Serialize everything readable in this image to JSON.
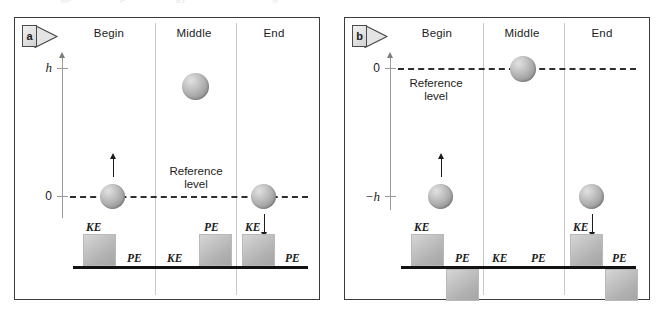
{
  "figure": {
    "caption_cut_off": "",
    "panels": [
      {
        "id": "a",
        "marker_letter": "a",
        "columns": [
          {
            "key": "begin",
            "label": "Begin"
          },
          {
            "key": "middle",
            "label": "Middle"
          },
          {
            "key": "end",
            "label": "End"
          }
        ],
        "axis": {
          "ticks": [
            {
              "key": "h",
              "label": "h",
              "italic": true
            },
            {
              "key": "zero",
              "label": "0",
              "italic": false
            }
          ]
        },
        "reference_label": {
          "line1": "Reference",
          "line2": "level"
        },
        "reference_level_value": "0",
        "balls": [
          {
            "column": "begin",
            "level": "0",
            "arrow": "up"
          },
          {
            "column": "middle",
            "level": "h",
            "arrow": "none"
          },
          {
            "column": "end",
            "level": "0",
            "arrow": "down"
          }
        ],
        "energy_bars": [
          {
            "column": "begin",
            "type": "KE",
            "label": "KE",
            "magnitude": "full",
            "direction": "above",
            "shown": true
          },
          {
            "column": "begin",
            "type": "PE",
            "label": "PE",
            "magnitude": "zero",
            "direction": "above",
            "shown": false
          },
          {
            "column": "middle",
            "type": "KE",
            "label": "KE",
            "magnitude": "zero",
            "direction": "above",
            "shown": false
          },
          {
            "column": "middle",
            "type": "PE",
            "label": "PE",
            "magnitude": "full",
            "direction": "above",
            "shown": true
          },
          {
            "column": "end",
            "type": "KE",
            "label": "KE",
            "magnitude": "full",
            "direction": "above",
            "shown": true
          },
          {
            "column": "end",
            "type": "PE",
            "label": "PE",
            "magnitude": "zero",
            "direction": "above",
            "shown": false
          }
        ]
      },
      {
        "id": "b",
        "marker_letter": "b",
        "columns": [
          {
            "key": "begin",
            "label": "Begin"
          },
          {
            "key": "middle",
            "label": "Middle"
          },
          {
            "key": "end",
            "label": "End"
          }
        ],
        "axis": {
          "ticks": [
            {
              "key": "zero",
              "label": "0",
              "italic": false
            },
            {
              "key": "minus_h",
              "label": "−h",
              "italic": true
            }
          ]
        },
        "reference_label": {
          "line1": "Reference",
          "line2": "level"
        },
        "reference_level_value": "0",
        "balls": [
          {
            "column": "begin",
            "level": "-h",
            "arrow": "up"
          },
          {
            "column": "middle",
            "level": "0",
            "arrow": "none"
          },
          {
            "column": "end",
            "level": "-h",
            "arrow": "down"
          }
        ],
        "energy_bars": [
          {
            "column": "begin",
            "type": "KE",
            "label": "KE",
            "magnitude": "full",
            "direction": "above",
            "shown": true
          },
          {
            "column": "begin",
            "type": "PE",
            "label": "PE",
            "magnitude": "negative",
            "direction": "below",
            "shown": true
          },
          {
            "column": "middle",
            "type": "KE",
            "label": "KE",
            "magnitude": "zero",
            "direction": "above",
            "shown": false
          },
          {
            "column": "middle",
            "type": "PE",
            "label": "PE",
            "magnitude": "zero",
            "direction": "above",
            "shown": false
          },
          {
            "column": "end",
            "type": "KE",
            "label": "KE",
            "magnitude": "full",
            "direction": "above",
            "shown": true
          },
          {
            "column": "end",
            "type": "PE",
            "label": "PE",
            "magnitude": "negative",
            "direction": "below",
            "shown": true
          }
        ]
      }
    ]
  },
  "panel_a": {
    "marker": "a",
    "head_begin": "Begin",
    "head_middle": "Middle",
    "head_end": "End",
    "tick_top": "h",
    "tick_zero": "0",
    "ref_line1": "Reference",
    "ref_line2": "level",
    "lbl_begin_ke": "KE",
    "lbl_begin_pe": "PE",
    "lbl_middle_ke": "KE",
    "lbl_middle_pe": "PE",
    "lbl_end_ke": "KE",
    "lbl_end_pe": "PE"
  },
  "panel_b": {
    "marker": "b",
    "head_begin": "Begin",
    "head_middle": "Middle",
    "head_end": "End",
    "tick_top": "0",
    "tick_bottom": "−h",
    "ref_line1": "Reference",
    "ref_line2": "level",
    "lbl_begin_ke": "KE",
    "lbl_begin_pe": "PE",
    "lbl_middle_ke": "KE",
    "lbl_middle_pe": "PE",
    "lbl_end_ke": "KE",
    "lbl_end_pe": "PE"
  },
  "colors": {
    "panel_border": "#3c3c3c",
    "divider": "#c9c9c9",
    "axis": "#9a9a9a",
    "refline": "#2e2e2e",
    "baseline": "#121212",
    "bar_fill": "#bdbdbd",
    "ball_fill": "#b4b4b4",
    "text": "#1c1c1c"
  }
}
